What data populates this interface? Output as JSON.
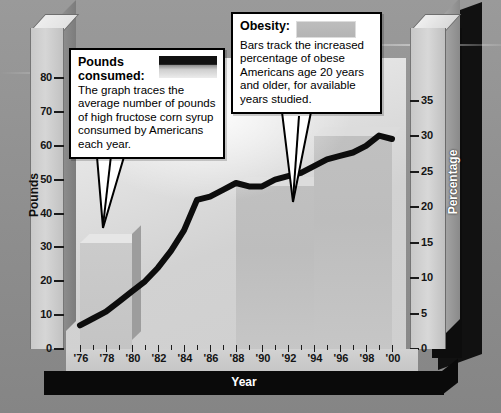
{
  "axes": {
    "left_title": "Pounds",
    "right_title": "Percentage",
    "x_title": "Year",
    "left_ticks": [
      "0",
      "10",
      "20",
      "30",
      "40",
      "50",
      "60",
      "70",
      "80"
    ],
    "right_ticks": [
      "0",
      "5",
      "10",
      "15",
      "20",
      "25",
      "30",
      "35"
    ],
    "x_ticks": [
      "'76",
      "'78",
      "'80",
      "'82",
      "'84",
      "'86",
      "'88",
      "'90",
      "'92",
      "'94",
      "'96",
      "'98",
      "'00"
    ]
  },
  "callouts": {
    "pounds": {
      "title": "Pounds consumed:",
      "body": "The graph traces the average number of pounds of high fructose corn syrup consumed by Americans each year.",
      "swatch": "black-line-swatch"
    },
    "obesity": {
      "title": "Obesity:",
      "body": "Bars track the increased percentage of obese Americans age 20 years and older, for available years studied.",
      "swatch": "gray-bar-swatch"
    }
  },
  "colors": {
    "line": "#0d0d0d",
    "bar": "#c0c0c0",
    "panel": "#d8d8d8",
    "background": "#8e8e8e",
    "axis_bar": "#0a0a0a"
  },
  "chart_data": {
    "type": "line",
    "title": "",
    "xlabel": "Year",
    "ylabel": "Pounds",
    "y2label": "Percentage",
    "xlim": [
      1975,
      2001
    ],
    "ylim": [
      0,
      85
    ],
    "y2lim": [
      0,
      37
    ],
    "grid": false,
    "legend_position": "callout-boxes",
    "series": [
      {
        "name": "Pounds consumed",
        "type": "line",
        "axis": "left",
        "units": "pounds per person per year",
        "color": "#0d0d0d",
        "x": [
          1976,
          1977,
          1978,
          1979,
          1980,
          1981,
          1982,
          1983,
          1984,
          1985,
          1986,
          1987,
          1988,
          1989,
          1990,
          1991,
          1992,
          1993,
          1994,
          1995,
          1996,
          1997,
          1998,
          1999,
          2000
        ],
        "values": [
          7,
          9,
          11,
          14,
          17,
          20,
          24,
          29,
          35,
          44,
          45,
          47,
          49,
          48,
          48,
          50,
          51,
          52,
          54,
          56,
          57,
          58,
          60,
          63,
          62
        ]
      },
      {
        "name": "Obesity",
        "type": "bar",
        "axis": "right",
        "units": "percent of Americans age 20 and older",
        "color": "#c0c0c0",
        "bars": [
          {
            "label": "1976-1980",
            "start": 1976,
            "end": 1980,
            "value": 15
          },
          {
            "label": "1988-1994",
            "start": 1988,
            "end": 1994,
            "value": 23
          },
          {
            "label": "1994-2000",
            "start": 1994,
            "end": 2000,
            "value": 30
          }
        ]
      }
    ]
  }
}
